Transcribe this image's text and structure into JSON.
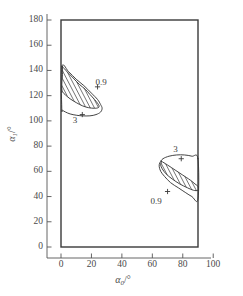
{
  "chart_data": {
    "type": "line",
    "title": "",
    "xlabel": "α₀/°",
    "ylabel": "α₁/°",
    "xlim": [
      -10,
      105
    ],
    "ylim": [
      -10,
      190
    ],
    "frame_x": [
      0,
      90
    ],
    "frame_y": [
      0,
      180
    ],
    "grid": false,
    "legend": false,
    "xticks": [
      0,
      20,
      40,
      60,
      80,
      100
    ],
    "xticklabels": [
      "0",
      "20",
      "40",
      "60",
      "80",
      "100"
    ],
    "yticks": [
      0,
      20,
      40,
      60,
      80,
      100,
      120,
      140,
      160,
      180
    ],
    "yticklabels": [
      "0",
      "20",
      "40",
      "60",
      "80",
      "100",
      "120",
      "140",
      "160",
      "180"
    ],
    "annotations": [
      {
        "text": "0.9",
        "x": 28,
        "y": 130
      },
      {
        "text": "3",
        "x": 13,
        "y": 100
      },
      {
        "text": "3",
        "x": 79,
        "y": 77
      },
      {
        "text": "0.9",
        "x": 64,
        "y": 36
      }
    ],
    "markers": [
      {
        "symbol": "+",
        "x": 24,
        "y": 127
      },
      {
        "symbol": "+",
        "x": 14,
        "y": 105
      },
      {
        "symbol": "+",
        "x": 79,
        "y": 70
      },
      {
        "symbol": "+",
        "x": 70,
        "y": 44
      }
    ],
    "series": [
      {
        "name": "contour-0.9-upper-left",
        "label": "0.9",
        "closed": true,
        "hatched": true,
        "points": [
          [
            1,
            143
          ],
          [
            4,
            139
          ],
          [
            8,
            134
          ],
          [
            12,
            129
          ],
          [
            16,
            125
          ],
          [
            19,
            121
          ],
          [
            22,
            117
          ],
          [
            24,
            114
          ],
          [
            25,
            112
          ],
          [
            24.5,
            110.5
          ],
          [
            22,
            110
          ],
          [
            18,
            110.5
          ],
          [
            14,
            112
          ],
          [
            10,
            114.5
          ],
          [
            6,
            117.5
          ],
          [
            3,
            120.5
          ],
          [
            1,
            123
          ],
          [
            0.5,
            126
          ],
          [
            0.6,
            131
          ],
          [
            1,
            137
          ],
          [
            1,
            143
          ]
        ]
      },
      {
        "name": "contour-3-upper-left",
        "label": "3",
        "closed": true,
        "hatched": false,
        "points": [
          [
            0.5,
            143
          ],
          [
            5,
            139
          ],
          [
            10,
            133
          ],
          [
            15,
            128
          ],
          [
            20,
            122
          ],
          [
            24,
            117
          ],
          [
            26,
            113
          ],
          [
            27,
            110
          ],
          [
            26,
            107
          ],
          [
            23,
            105
          ],
          [
            19,
            104
          ],
          [
            14,
            104
          ],
          [
            10,
            104.5
          ],
          [
            6,
            105.5
          ],
          [
            3,
            107
          ],
          [
            1,
            108.5
          ],
          [
            0.5,
            110
          ]
        ]
      },
      {
        "name": "contour-0.9-lower-right",
        "label": "0.9",
        "closed": true,
        "hatched": true,
        "points": [
          [
            66,
            68
          ],
          [
            70,
            65
          ],
          [
            75,
            61
          ],
          [
            80,
            57
          ],
          [
            85,
            53
          ],
          [
            88,
            50
          ],
          [
            90,
            48
          ],
          [
            90,
            45
          ],
          [
            87,
            45
          ],
          [
            83,
            47
          ],
          [
            78,
            50
          ],
          [
            73,
            54
          ],
          [
            69,
            58
          ],
          [
            66.5,
            62
          ],
          [
            65.5,
            65
          ],
          [
            66,
            68
          ]
        ]
      },
      {
        "name": "contour-3-lower-right",
        "label": "3",
        "closed": true,
        "hatched": false,
        "points": [
          [
            90,
            70
          ],
          [
            86,
            72
          ],
          [
            81,
            73
          ],
          [
            76,
            73
          ],
          [
            71,
            72
          ],
          [
            67,
            70
          ],
          [
            65,
            67
          ],
          [
            64.5,
            64
          ],
          [
            65.5,
            60
          ],
          [
            68,
            56
          ],
          [
            72,
            51
          ],
          [
            77,
            47
          ],
          [
            82,
            43
          ],
          [
            86,
            40
          ],
          [
            90,
            38
          ]
        ]
      }
    ]
  },
  "axes": {
    "y_title_main": "α",
    "y_title_sub": "1",
    "y_title_unit": "/°",
    "x_title_main": "α",
    "x_title_sub": "0",
    "x_title_unit": "/°"
  }
}
